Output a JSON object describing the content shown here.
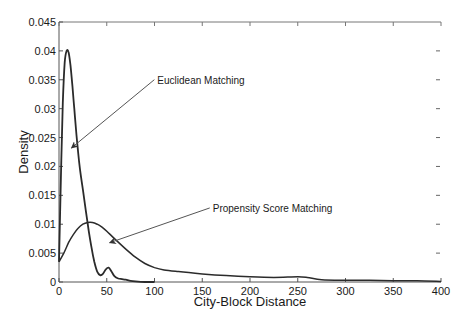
{
  "chart_data": {
    "type": "line",
    "title": "",
    "xlabel": "City-Block Distance",
    "ylabel": "Density",
    "xlim": [
      0,
      400
    ],
    "ylim": [
      0,
      0.045
    ],
    "xticks": [
      0,
      50,
      100,
      150,
      200,
      250,
      300,
      350,
      400
    ],
    "xtick_labels": [
      "0",
      "50",
      "100",
      "150",
      "200",
      "250",
      "300",
      "350",
      "400"
    ],
    "yticks": [
      0,
      0.005,
      0.01,
      0.015,
      0.02,
      0.025,
      0.03,
      0.035,
      0.04,
      0.045
    ],
    "ytick_labels": [
      "0",
      "0.005",
      "0.01",
      "0.015",
      "0.02",
      "0.025",
      "0.03",
      "0.035",
      "0.04",
      "0.045"
    ],
    "grid": false,
    "legend": "none (inline annotations with arrows)",
    "series": [
      {
        "name": "Euclidean Matching",
        "x": [
          0,
          2,
          4,
          6,
          8,
          10,
          12,
          14,
          16,
          18,
          20,
          22,
          25,
          28,
          31,
          34,
          37,
          40,
          43,
          46,
          49,
          52,
          55,
          58,
          62,
          66,
          70,
          75,
          80,
          90,
          100
        ],
        "y": [
          0.0035,
          0.018,
          0.031,
          0.038,
          0.04,
          0.0398,
          0.0375,
          0.034,
          0.03,
          0.026,
          0.0225,
          0.0195,
          0.016,
          0.0125,
          0.009,
          0.006,
          0.0035,
          0.0018,
          0.0012,
          0.0014,
          0.0022,
          0.0025,
          0.0018,
          0.001,
          0.0006,
          0.0005,
          0.0004,
          0.0002,
          0.0001,
          0.0,
          0.0
        ]
      },
      {
        "name": "Propensity Score Matching",
        "x": [
          0,
          5,
          10,
          15,
          20,
          25,
          30,
          35,
          40,
          45,
          50,
          60,
          70,
          80,
          90,
          100,
          110,
          125,
          150,
          175,
          200,
          225,
          250,
          260,
          275,
          300,
          325,
          350,
          375,
          400
        ],
        "y": [
          0.0035,
          0.005,
          0.0068,
          0.0082,
          0.0093,
          0.01,
          0.0103,
          0.0103,
          0.01,
          0.0095,
          0.0088,
          0.0072,
          0.0057,
          0.0043,
          0.0032,
          0.0025,
          0.0021,
          0.0018,
          0.0014,
          0.0011,
          0.0009,
          0.0008,
          0.0009,
          0.0008,
          0.0004,
          0.0003,
          0.0003,
          0.0002,
          0.0002,
          0.0001
        ]
      }
    ],
    "annotations": [
      {
        "text": "Euclidean Matching",
        "text_x": 103,
        "text_y": 0.0345,
        "arrow_to_x": 13,
        "arrow_to_y": 0.0232
      },
      {
        "text": "Propensity Score Matching",
        "text_x": 161,
        "text_y": 0.0123,
        "arrow_to_x": 53,
        "arrow_to_y": 0.0068
      }
    ],
    "line_color": "#2b2b2b",
    "arrow_color": "#555555"
  },
  "axes_px": {
    "left": 59,
    "right": 441,
    "top": 22,
    "bottom": 282
  }
}
